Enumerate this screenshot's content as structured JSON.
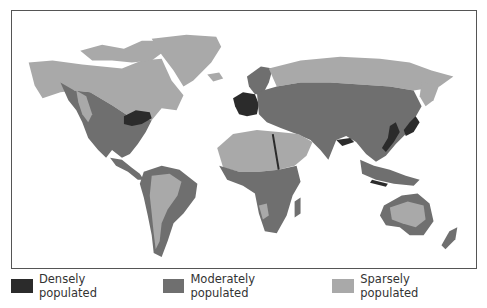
{
  "map": {
    "type": "choropleth",
    "subject": "World population density",
    "legend": [
      {
        "label": "Densely populated",
        "color": "#2b2b2b"
      },
      {
        "label": "Moderately populated",
        "color": "#6f6f6f"
      },
      {
        "label": "Sparsely populated",
        "color": "#a9a9a9"
      }
    ],
    "colors": {
      "dense": "#2b2b2b",
      "moderate": "#6f6f6f",
      "sparse": "#a9a9a9",
      "ocean": "#ffffff",
      "frame": "#555555"
    }
  }
}
